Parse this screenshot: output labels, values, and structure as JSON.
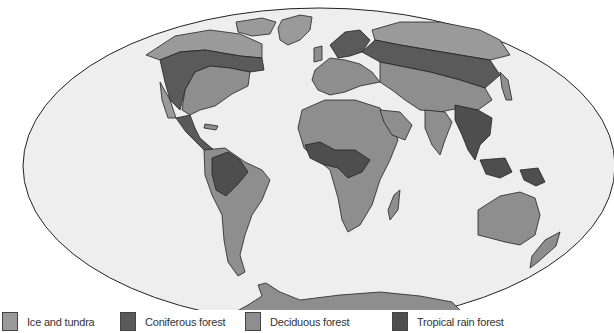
{
  "map": {
    "projection": "Mollweide (elliptical world map)",
    "ocean_color": "#eeeeee",
    "outline_color": "#222222",
    "regions": [
      "North America",
      "Greenland",
      "Central America",
      "South America",
      "Europe",
      "Africa",
      "Madagascar",
      "Asia",
      "Arabia",
      "India",
      "Southeast Asia",
      "Indonesia",
      "New Guinea",
      "Japan",
      "Australia",
      "New Zealand",
      "Antarctica"
    ]
  },
  "legend": {
    "items": [
      {
        "label": "Ice and tundra",
        "color": "#9a9a9a"
      },
      {
        "label": "Coniferous forest",
        "color": "#5a5a5a"
      },
      {
        "label": "Deciduous forest",
        "color": "#8e8e8e"
      },
      {
        "label": "Tropical rain forest",
        "color": "#4e4e4e"
      }
    ]
  }
}
